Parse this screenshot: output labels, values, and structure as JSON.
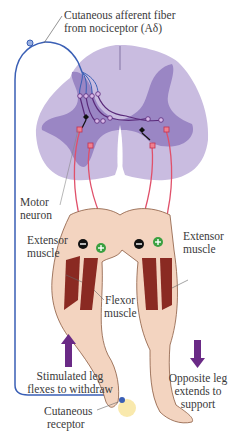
{
  "figure": {
    "labels": {
      "afferent_line1": "Cutaneous afferent fiber",
      "afferent_line2": "from nociceptor (Aδ)",
      "motor_line1": "Motor",
      "motor_line2": "neuron",
      "extensor_left_line1": "Extensor",
      "extensor_left_line2": "muscle",
      "extensor_right_line1": "Extensor",
      "extensor_right_line2": "muscle",
      "flexor_line1": "Flexor",
      "flexor_line2": "muscle",
      "stimulated_line1": "Stimulated leg",
      "stimulated_line2": "flexes to withdraw",
      "opposite_line1": "Opposite leg",
      "opposite_line2": "extends to",
      "opposite_line3": "support",
      "receptor_line1": "Cutaneous",
      "receptor_line2": "receptor"
    },
    "symbols": {
      "inhibit": "−",
      "excite": "+"
    },
    "arrows": {
      "left": "up",
      "right": "down"
    },
    "colors": {
      "afferent_fiber": "#3a5fb5",
      "interneuron": "#5a2a7a",
      "motor_fiber": "#e0506a",
      "spinal_white_matter": "#c9bce0",
      "spinal_gray_matter": "#9a86c4",
      "skin": "#f3d4c0",
      "muscle": "#8a2a22",
      "arrow": "#6a2a86",
      "excite_badge": "#3aa040",
      "inhibit_badge": "#111111"
    }
  }
}
